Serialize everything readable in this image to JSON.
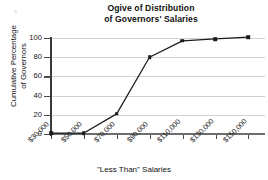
{
  "chart_data": {
    "type": "line",
    "title": "Ogive of Distribution of Governors' Salaries",
    "title_line1": "Ogive of Distribution",
    "title_line2": "of Governors' Salaries",
    "xlabel": "\"Less Than\" Salaries",
    "ylabel": "Cumulative Percentage of Governors",
    "ylabel_line1": "Cumulative Percentage",
    "ylabel_line2": "of Governors",
    "categories": [
      "$30,000",
      "$50,000",
      "$70,000",
      "$90,000",
      "$110,000",
      "$130,000",
      "$150,000"
    ],
    "x": [
      30000,
      50000,
      70000,
      90000,
      110000,
      130000,
      150000
    ],
    "values": [
      1,
      1,
      21,
      80,
      97,
      99,
      101
    ],
    "ylim": [
      0,
      100
    ],
    "yticks": [
      0,
      20,
      40,
      60,
      80,
      100
    ],
    "ytick_labels": [
      "0",
      "20",
      "40",
      "60",
      "80",
      "100"
    ],
    "grid": "horizontal",
    "legend": "none",
    "marker": "square",
    "line_color": "#1a1a1a",
    "grid_color": "#d2d2d2",
    "axis_color": "#4a4a4a"
  }
}
